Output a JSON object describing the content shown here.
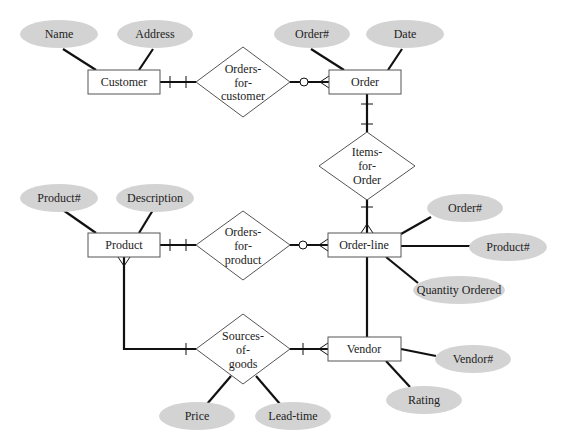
{
  "diagram": {
    "type": "entity-relationship",
    "entities": [
      {
        "id": "customer",
        "label": "Customer"
      },
      {
        "id": "order",
        "label": "Order"
      },
      {
        "id": "product",
        "label": "Product"
      },
      {
        "id": "order_line",
        "label": "Order-line"
      },
      {
        "id": "vendor",
        "label": "Vendor"
      }
    ],
    "relationships": [
      {
        "id": "orders_for_customer",
        "lines": [
          "Orders-",
          "for-",
          "customer"
        ]
      },
      {
        "id": "items_for_order",
        "lines": [
          "Items-",
          "for-",
          "Order"
        ]
      },
      {
        "id": "orders_for_product",
        "lines": [
          "Orders-",
          "for-",
          "product"
        ]
      },
      {
        "id": "sources_of_goods",
        "lines": [
          "Sources-",
          "of-",
          "goods"
        ]
      }
    ],
    "attributes": {
      "customer_name": "Name",
      "customer_address": "Address",
      "order_number": "Order#",
      "order_date": "Date",
      "product_number": "Product#",
      "product_description": "Description",
      "orderline_order_number": "Order#",
      "orderline_product_number": "Product#",
      "orderline_quantity": "Quantity Ordered",
      "vendor_number": "Vendor#",
      "vendor_rating": "Rating",
      "sog_price": "Price",
      "sog_lead_time": "Lead-time"
    },
    "connections": [
      {
        "from": "Customer",
        "to": "Orders-for-customer",
        "end_marker": "one-and-only-one"
      },
      {
        "from": "Orders-for-customer",
        "to": "Order",
        "end_marker": "zero-or-many"
      },
      {
        "from": "Order",
        "to": "Items-for-Order",
        "end_marker": "one-and-only-one"
      },
      {
        "from": "Items-for-Order",
        "to": "Order-line",
        "end_marker": "one-or-many"
      },
      {
        "from": "Product",
        "to": "Orders-for-product",
        "end_marker": "one-and-only-one"
      },
      {
        "from": "Orders-for-product",
        "to": "Order-line",
        "end_marker": "zero-or-many"
      },
      {
        "from": "Product",
        "to": "Sources-of-goods",
        "end_marker": "one-or-many / one"
      },
      {
        "from": "Sources-of-goods",
        "to": "Vendor",
        "end_marker": "one-or-many"
      },
      {
        "from": "Order-line",
        "to": "Vendor",
        "end_marker": "none"
      }
    ],
    "colors": {
      "attribute_fill": "#d3d3d3",
      "entity_fill": "#ffffff",
      "line": "#111111"
    }
  }
}
